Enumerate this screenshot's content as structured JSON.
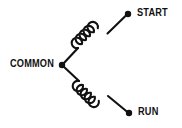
{
  "diagram": {
    "type": "electrical-schematic",
    "background_color": "#ffffff",
    "line_color": "#111111",
    "terminals": [
      {
        "id": "common",
        "label": "COMMON",
        "x": 62,
        "y": 65,
        "marker": "junction-dot"
      },
      {
        "id": "start",
        "label": "START",
        "x": 128,
        "y": 14,
        "marker": "terminal-dot"
      },
      {
        "id": "run",
        "label": "RUN",
        "x": 129,
        "y": 113,
        "marker": "terminal-dot"
      }
    ],
    "windings": [
      {
        "id": "start-winding",
        "from": "common",
        "to": "start",
        "turns": 5,
        "orientation": "up-right"
      },
      {
        "id": "run-winding",
        "from": "common",
        "to": "run",
        "turns": 5,
        "orientation": "down-right"
      }
    ]
  },
  "labels": {
    "common": "COMMON",
    "start": "START",
    "run": "RUN"
  }
}
